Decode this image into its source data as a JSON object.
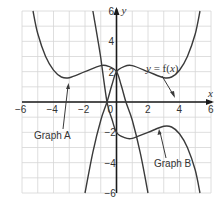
{
  "chart_data": {
    "type": "line",
    "title": "",
    "xlabel": "x",
    "ylabel": "y",
    "xlim": [
      -6,
      6
    ],
    "ylim": [
      -6,
      6
    ],
    "grid": true,
    "grid_step": 1,
    "x_ticks": [
      "-6",
      "-4",
      "-2",
      "0",
      "2",
      "4",
      "6"
    ],
    "y_ticks": [
      "-6",
      "-4",
      "-2",
      "2",
      "4",
      "6"
    ],
    "series": [
      {
        "name": "y = f(x)",
        "points": [
          [
            -2.0,
            -6
          ],
          [
            -1.5,
            -3.3
          ],
          [
            -1,
            -1.2
          ],
          [
            -0.6,
            0
          ],
          [
            -0.3,
            1.1
          ],
          [
            0,
            2
          ],
          [
            0.5,
            2.35
          ],
          [
            1,
            2.4
          ],
          [
            2,
            2.0
          ],
          [
            3,
            1.6
          ],
          [
            3.5,
            1.65
          ],
          [
            4,
            2.1
          ],
          [
            4.5,
            3.0
          ],
          [
            5,
            4.5
          ],
          [
            5.3,
            6
          ]
        ]
      },
      {
        "name": "Graph A",
        "points": [
          [
            -5.3,
            6
          ],
          [
            -5,
            4.5
          ],
          [
            -4.5,
            3.0
          ],
          [
            -4,
            2.1
          ],
          [
            -3.5,
            1.65
          ],
          [
            -3,
            1.6
          ],
          [
            -2,
            2.0
          ],
          [
            -1,
            2.4
          ],
          [
            -0.5,
            2.35
          ],
          [
            0,
            2
          ],
          [
            0.3,
            1.1
          ],
          [
            0.6,
            0
          ],
          [
            1,
            -1.2
          ],
          [
            1.5,
            -3.3
          ],
          [
            2.0,
            -6
          ]
        ]
      },
      {
        "name": "Graph B",
        "points": [
          [
            -1.5,
            6
          ],
          [
            -1.2,
            4.2
          ],
          [
            -1,
            2.9
          ],
          [
            -0.6,
            0
          ],
          [
            -0.3,
            -1.1
          ],
          [
            0,
            -2
          ],
          [
            0.5,
            -2.35
          ],
          [
            1,
            -2.4
          ],
          [
            2,
            -2.0
          ],
          [
            3,
            -1.6
          ],
          [
            3.5,
            -1.65
          ],
          [
            4,
            -2.1
          ],
          [
            4.5,
            -3.0
          ],
          [
            5,
            -4.5
          ],
          [
            5.3,
            -6
          ]
        ]
      }
    ],
    "annotations": [
      {
        "text": "y = f(x)",
        "points_to": [
          3.6,
          1.7
        ]
      },
      {
        "text": "Graph A",
        "points_to": [
          -3,
          1.6
        ]
      },
      {
        "text": "Graph B",
        "points_to": [
          2.8,
          -1.6
        ]
      }
    ]
  },
  "labels": {
    "x_axis": "x",
    "y_axis": "y",
    "f_label_y": "y",
    "f_label_rest": " = f(",
    "f_label_x": "x",
    "f_label_close": ")",
    "graph_a": "Graph A",
    "graph_b": "Graph B",
    "origin": "0"
  },
  "colors": {
    "grid": "#d6d6d6",
    "axis": "#1a1a1a",
    "curve": "#3a3a3a"
  }
}
